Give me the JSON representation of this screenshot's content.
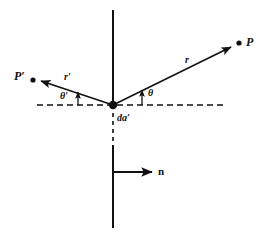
{
  "diagram": {
    "background_color": "#ffffff",
    "stroke_color": "#111111",
    "labels": {
      "point_p": "P",
      "point_p_prime": "P′",
      "ray_r": "r",
      "ray_r_prime": "r′",
      "angle_theta": "θ",
      "angle_theta_prime": "θ′",
      "area_element": "da′",
      "normal_vector": "n"
    },
    "geometry": {
      "origin": {
        "x": 113,
        "y": 105
      },
      "point_p": {
        "x": 239,
        "y": 43
      },
      "point_p_prime": {
        "x": 33,
        "y": 80
      },
      "dashed_axis": {
        "x1": 37,
        "x2": 226,
        "y": 105
      },
      "vertical_axis": {
        "x": 113,
        "y_top": 10,
        "y_bottom": 228
      },
      "normal_arrow": {
        "x1": 113,
        "x2": 158,
        "y": 172
      }
    }
  }
}
